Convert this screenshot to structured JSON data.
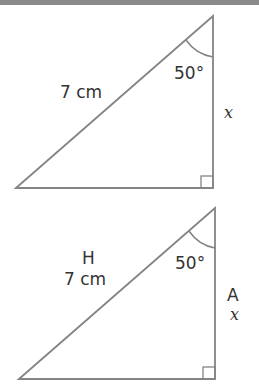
{
  "diagram": {
    "stroke_color": "#848484",
    "text_color": "#333333",
    "triangles": [
      {
        "id": "triangle-1",
        "vertices": {
          "bottom_left": [
            16,
            188
          ],
          "top": [
            213,
            16
          ],
          "right_angle": [
            213,
            188
          ]
        },
        "hypotenuse_label": "7 cm",
        "angle_label": "50°",
        "side_label": "x",
        "hypotenuse_name": null,
        "side_name": null
      },
      {
        "id": "triangle-2",
        "vertices": {
          "bottom_left": [
            19,
            379
          ],
          "top": [
            215,
            208
          ],
          "right_angle": [
            215,
            379
          ]
        },
        "hypotenuse_label": "7 cm",
        "angle_label": "50°",
        "side_label": "x",
        "hypotenuse_name": "H",
        "side_name": "A"
      }
    ]
  },
  "t1": {
    "hyp": "7 cm",
    "angle": "50°",
    "side": "x"
  },
  "t2": {
    "hypname": "H",
    "hyp": "7 cm",
    "angle": "50°",
    "sidename": "A",
    "side": "x"
  }
}
